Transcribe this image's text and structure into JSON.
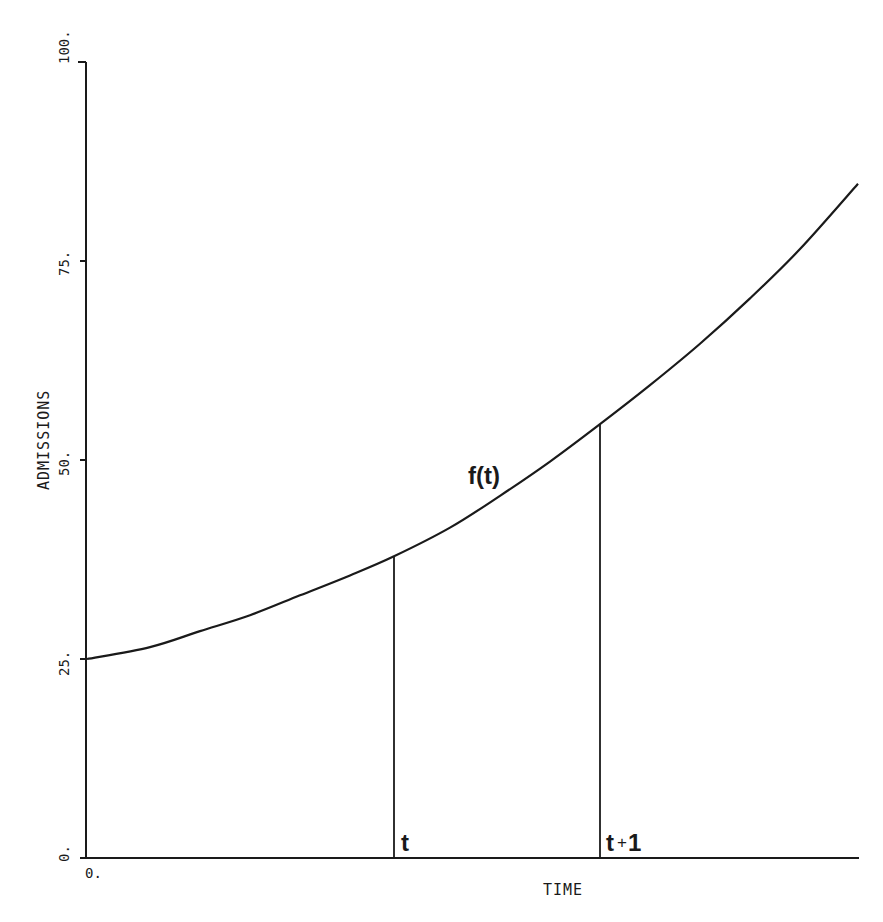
{
  "chart_data": {
    "type": "line",
    "title": "",
    "xlabel": "TIME",
    "ylabel": "ADMISSIONS",
    "ylim": [
      0,
      100
    ],
    "yticks": [
      0,
      25,
      50,
      75,
      100
    ],
    "ytick_labels": [
      "0.",
      "25.",
      "50.",
      "75.",
      "100."
    ],
    "xtick_labels": [
      "0."
    ],
    "grid": false,
    "legend": null,
    "series": [
      {
        "name": "f(t)",
        "x_px": [
          87,
          150,
          200,
          250,
          300,
          350,
          394,
          450,
          500,
          550,
          600,
          650,
          700,
          750,
          800,
          858
        ],
        "values": [
          25.0,
          26.5,
          28.5,
          30.5,
          33.0,
          35.5,
          37.9,
          41.5,
          45.5,
          49.8,
          54.5,
          59.4,
          64.6,
          70.3,
          76.5,
          84.7
        ]
      }
    ],
    "annotations": [
      {
        "text": "f(t)",
        "kind": "curve-label"
      },
      {
        "text": "t",
        "kind": "vertical-marker",
        "x_px": 394,
        "value_at_curve": 37.9
      },
      {
        "text": "t+1",
        "kind": "vertical-marker",
        "x_px": 600,
        "value_at_curve": 54.5
      }
    ]
  },
  "labels": {
    "y_axis_title": "ADMISSIONS",
    "x_axis_title": "TIME",
    "y_ticks": [
      "0.",
      "25.",
      "50.",
      "75.",
      "100."
    ],
    "x_origin": "0.",
    "curve_label": "f(t)",
    "marker_t": "t",
    "marker_t1_base": "t",
    "marker_t1_plus": "+",
    "marker_t1_one": "1"
  }
}
